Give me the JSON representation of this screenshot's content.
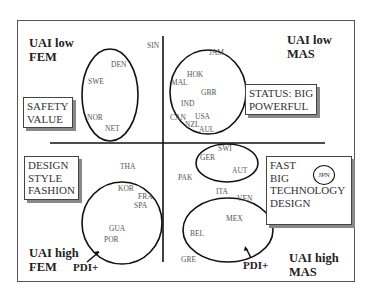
{
  "quadrants": {
    "top_left": {
      "label_line1": "UAI low",
      "label_line2": "FEM",
      "box": "SAFETY\nVALUE"
    },
    "top_right": {
      "label_line1": "UAI low",
      "label_line2": "MAS",
      "box": "STATUS: BIG\nPOWERFUL"
    },
    "bottom_left": {
      "label_line1": "UAI high",
      "label_line2": "FEM",
      "box": "DESIGN\nSTYLE\nFASHION"
    },
    "bottom_right": {
      "label_line1": "UAI high",
      "label_line2": "MAS",
      "box": "FAST\nBIG\nTECHNOLOGY\nDESIGN"
    }
  },
  "arrows": {
    "left": "PDI+",
    "right": "PDI+"
  },
  "countries": {
    "SIN": "SIN",
    "DEN": "DEN",
    "SWE": "SWE",
    "NOR": "NOR",
    "NET": "NET",
    "JAM": "JAM",
    "HOK": "HOK",
    "MAL": "MAL",
    "GBR": "GBR",
    "IND": "IND",
    "CAN": "CAN",
    "USA": "USA",
    "NZL": "NZL",
    "AUL": "AUL",
    "SWI": "SWI",
    "GER": "GER",
    "AUT": "AUT",
    "PAK": "PAK",
    "ITA": "ITA",
    "VEN": "VEN",
    "MEX": "MEX",
    "BEL": "BEL",
    "GRE": "GRE",
    "THA": "THA",
    "KOR": "KOR",
    "FRA": "FRA",
    "SPA": "SPA",
    "GUA": "GUA",
    "POR": "POR",
    "JPN": "JPN"
  }
}
